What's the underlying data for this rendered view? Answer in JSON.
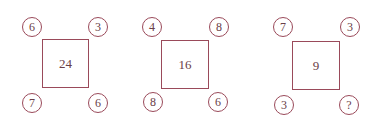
{
  "puzzle": {
    "stroke_color": "#9a4a5a",
    "text_color": "#6a4048",
    "panels": [
      {
        "center": "24",
        "top_left": "6",
        "top_right": "3",
        "bottom_left": "7",
        "bottom_right": "6"
      },
      {
        "center": "16",
        "top_left": "4",
        "top_right": "8",
        "bottom_left": "8",
        "bottom_right": "6"
      },
      {
        "center": "9",
        "top_left": "7",
        "top_right": "3",
        "bottom_left": "3",
        "bottom_right": "?"
      }
    ]
  }
}
